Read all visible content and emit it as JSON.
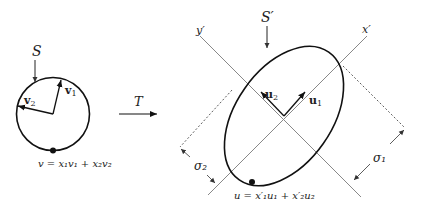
{
  "diagram": {
    "left": {
      "set_label": "S",
      "vector1_label": "v",
      "vector1_sub": "1",
      "vector2_label": "v",
      "vector2_sub": "2",
      "equation": "v = x₁v₁ + x₂v₂"
    },
    "transform": {
      "label": "T"
    },
    "right": {
      "set_label": "S′",
      "axis_x_label": "x′",
      "axis_y_label": "y′",
      "vector1_label": "u",
      "vector1_sub": "1",
      "vector2_label": "u",
      "vector2_sub": "2",
      "sigma1_label": "σ₁",
      "sigma2_label": "σ₂",
      "equation": "u = x′₁u₁ + x′₂u₂"
    }
  }
}
